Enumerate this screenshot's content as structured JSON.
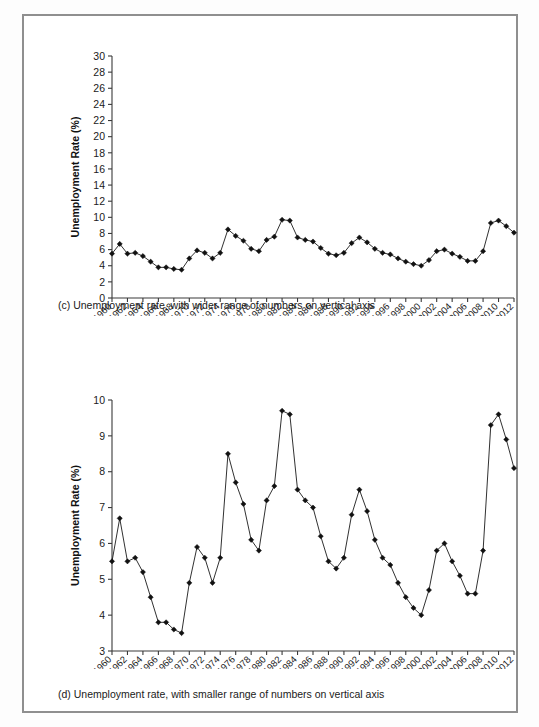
{
  "figure": {
    "panels": [
      {
        "id": "panel-c",
        "caption": "(c) Unemployment rate, with wider range of numbers on vertical axis",
        "ylabel": "Unemployment Rate (%)",
        "xlabel": "Year"
      },
      {
        "id": "panel-d",
        "caption": "(d) Unemployment rate, with smaller range of numbers on vertical axis",
        "ylabel": "Unemployment Rate (%)",
        "xlabel": "Year"
      }
    ]
  },
  "chart_data": [
    {
      "type": "line",
      "title": "(c) Unemployment rate, with wider range of numbers on vertical axis",
      "xlabel": "Year",
      "ylabel": "Unemployment Rate (%)",
      "ylim": [
        0,
        30
      ],
      "yticks": [
        0,
        2,
        4,
        6,
        8,
        10,
        12,
        14,
        16,
        18,
        20,
        22,
        24,
        26,
        28,
        30
      ],
      "ytick_labels": [
        "0",
        "2",
        "4",
        "6",
        "8",
        "10",
        "12",
        "14",
        "16",
        "18",
        "20",
        "22",
        "24",
        "26",
        "28",
        "30"
      ],
      "xlim": [
        1960,
        2012
      ],
      "xticks": [
        1960,
        1962,
        1964,
        1966,
        1968,
        1970,
        1972,
        1974,
        1976,
        1978,
        1980,
        1982,
        1984,
        1986,
        1988,
        1990,
        1992,
        1994,
        1996,
        1998,
        2000,
        2002,
        2004,
        2006,
        2008,
        2010,
        2012
      ],
      "xtick_labels": [
        "1960",
        "1962",
        "1964",
        "1966",
        "1968",
        "1970",
        "1972",
        "1974",
        "1976",
        "1978",
        "1980",
        "1982",
        "1984",
        "1986",
        "1988",
        "1990",
        "1992",
        "1994",
        "1996",
        "1998",
        "2000",
        "2002",
        "2004",
        "2006",
        "2008",
        "2010",
        "2012"
      ],
      "grid": false,
      "legend": "none",
      "marker": "diamond",
      "x": [
        1960,
        1961,
        1962,
        1963,
        1964,
        1965,
        1966,
        1967,
        1968,
        1969,
        1970,
        1971,
        1972,
        1973,
        1974,
        1975,
        1976,
        1977,
        1978,
        1979,
        1980,
        1981,
        1982,
        1983,
        1984,
        1985,
        1986,
        1987,
        1988,
        1989,
        1990,
        1991,
        1992,
        1993,
        1994,
        1995,
        1996,
        1997,
        1998,
        1999,
        2000,
        2001,
        2002,
        2003,
        2004,
        2005,
        2006,
        2007,
        2008,
        2009,
        2010,
        2011,
        2012
      ],
      "values": [
        5.5,
        6.7,
        5.5,
        5.6,
        5.2,
        4.5,
        3.8,
        3.8,
        3.6,
        3.5,
        4.9,
        5.9,
        5.6,
        4.9,
        5.6,
        8.5,
        7.7,
        7.1,
        6.1,
        5.8,
        7.2,
        7.6,
        9.7,
        9.6,
        7.5,
        7.2,
        7.0,
        6.2,
        5.5,
        5.3,
        5.6,
        6.8,
        7.5,
        6.9,
        6.1,
        5.6,
        5.4,
        4.9,
        4.5,
        4.2,
        4.0,
        4.7,
        5.8,
        6.0,
        5.5,
        5.1,
        4.6,
        4.6,
        5.8,
        9.3,
        9.6,
        8.9,
        8.1
      ]
    },
    {
      "type": "line",
      "title": "(d) Unemployment rate, with smaller range of numbers on vertical axis",
      "xlabel": "Year",
      "ylabel": "Unemployment Rate (%)",
      "ylim": [
        3,
        10
      ],
      "yticks": [
        3,
        4,
        5,
        6,
        7,
        8,
        9,
        10
      ],
      "ytick_labels": [
        "3",
        "4",
        "5",
        "6",
        "7",
        "8",
        "9",
        "10"
      ],
      "xlim": [
        1960,
        2012
      ],
      "xticks": [
        1960,
        1962,
        1964,
        1966,
        1968,
        1970,
        1972,
        1974,
        1976,
        1978,
        1980,
        1982,
        1984,
        1986,
        1988,
        1990,
        1992,
        1994,
        1996,
        1998,
        2000,
        2002,
        2004,
        2006,
        2008,
        2010,
        2012
      ],
      "xtick_labels": [
        "1960",
        "1962",
        "1964",
        "1966",
        "1968",
        "1970",
        "1972",
        "1974",
        "1976",
        "1978",
        "1980",
        "1982",
        "1984",
        "1986",
        "1988",
        "1990",
        "1992",
        "1994",
        "1996",
        "1998",
        "2000",
        "2002",
        "2004",
        "2006",
        "2008",
        "2010",
        "2012"
      ],
      "grid": false,
      "legend": "none",
      "marker": "diamond",
      "x": [
        1960,
        1961,
        1962,
        1963,
        1964,
        1965,
        1966,
        1967,
        1968,
        1969,
        1970,
        1971,
        1972,
        1973,
        1974,
        1975,
        1976,
        1977,
        1978,
        1979,
        1980,
        1981,
        1982,
        1983,
        1984,
        1985,
        1986,
        1987,
        1988,
        1989,
        1990,
        1991,
        1992,
        1993,
        1994,
        1995,
        1996,
        1997,
        1998,
        1999,
        2000,
        2001,
        2002,
        2003,
        2004,
        2005,
        2006,
        2007,
        2008,
        2009,
        2010,
        2011,
        2012
      ],
      "values": [
        5.5,
        6.7,
        5.5,
        5.6,
        5.2,
        4.5,
        3.8,
        3.8,
        3.6,
        3.5,
        4.9,
        5.9,
        5.6,
        4.9,
        5.6,
        8.5,
        7.7,
        7.1,
        6.1,
        5.8,
        7.2,
        7.6,
        9.7,
        9.6,
        7.5,
        7.2,
        7.0,
        6.2,
        5.5,
        5.3,
        5.6,
        6.8,
        7.5,
        6.9,
        6.1,
        5.6,
        5.4,
        4.9,
        4.5,
        4.2,
        4.0,
        4.7,
        5.8,
        6.0,
        5.5,
        5.1,
        4.6,
        4.6,
        5.8,
        9.3,
        9.6,
        8.9,
        8.1
      ]
    }
  ],
  "colors": {
    "line": "#1a1a1a",
    "marker": "#111111",
    "axis": "#3a3a3a",
    "frame": "#8f8f8f",
    "text": "#1a1a1a"
  }
}
